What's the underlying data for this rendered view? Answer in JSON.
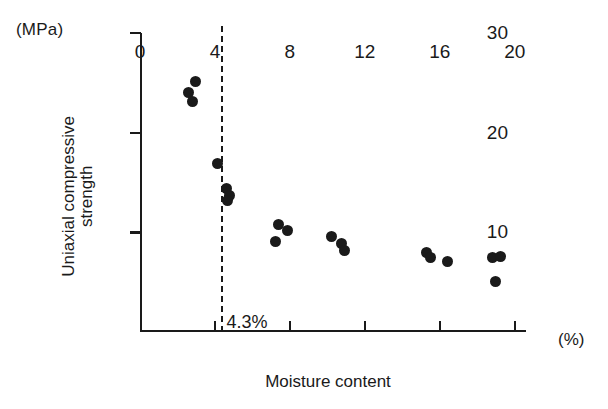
{
  "chart_data": {
    "type": "scatter",
    "title": "",
    "xlabel": "Moisture content",
    "ylabel": "Uniaxial compressive\nstrength",
    "x_unit": "(%)",
    "y_unit": "(MPa)",
    "xlim": [
      0,
      20.6
    ],
    "ylim": [
      0,
      30
    ],
    "xticks": [
      0,
      4,
      8,
      12,
      16,
      20
    ],
    "xtick_labels": [
      "0",
      "4",
      "8",
      "12",
      "16",
      "20"
    ],
    "yticks": [
      10,
      20,
      30
    ],
    "ytick_labels": [
      "10",
      "20",
      "30"
    ],
    "grid": false,
    "legend": "none",
    "marker": "filled-circle",
    "marker_color": "#1a1a1a",
    "annotations": [
      {
        "name": "threshold-line",
        "type": "vline",
        "x": 4.3,
        "style": "dashed",
        "label": "4.3%"
      }
    ],
    "points": [
      {
        "x": 2.6,
        "y": 24.0
      },
      {
        "x": 2.95,
        "y": 25.1
      },
      {
        "x": 2.8,
        "y": 23.1
      },
      {
        "x": 4.15,
        "y": 16.9
      },
      {
        "x": 4.6,
        "y": 14.4
      },
      {
        "x": 4.75,
        "y": 13.7
      },
      {
        "x": 4.65,
        "y": 13.2
      },
      {
        "x": 7.25,
        "y": 9.1
      },
      {
        "x": 7.4,
        "y": 10.8
      },
      {
        "x": 7.85,
        "y": 10.2
      },
      {
        "x": 10.2,
        "y": 9.6
      },
      {
        "x": 10.75,
        "y": 8.9
      },
      {
        "x": 10.9,
        "y": 8.2
      },
      {
        "x": 15.3,
        "y": 8.0
      },
      {
        "x": 15.5,
        "y": 7.5
      },
      {
        "x": 16.4,
        "y": 7.1
      },
      {
        "x": 18.8,
        "y": 7.5
      },
      {
        "x": 19.25,
        "y": 7.6
      },
      {
        "x": 18.95,
        "y": 5.1
      }
    ]
  }
}
